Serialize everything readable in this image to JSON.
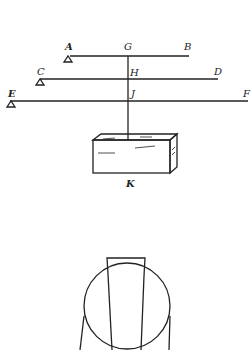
{
  "diagram": {
    "colors": {
      "ink": "#222222",
      "background": "#ffffff"
    },
    "levers": [
      {
        "left": "A",
        "center": "G",
        "right": "B"
      },
      {
        "left": "C",
        "center": "H",
        "right": "D"
      },
      {
        "left": "E",
        "center": "J",
        "right": "F"
      }
    ],
    "weight_label": "K",
    "lower_figure": "circle-with-trapezoid"
  }
}
